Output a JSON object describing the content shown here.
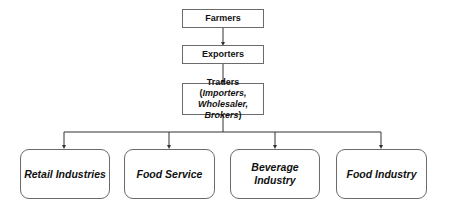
{
  "diagram": {
    "nodes": {
      "farmers": "Farmers",
      "exporters": "Exporters",
      "traders": {
        "prefix": "Traders (",
        "importers": "Importers,",
        "wholesaler": "Wholesaler,",
        "brokers": "Brokers",
        "suffix": ")"
      },
      "retail": "Retail Industries",
      "food_service": "Food Service",
      "beverage_line1": "Beverage",
      "beverage_line2": "Industry",
      "food_industry": "Food Industry"
    },
    "edges": [
      [
        "Farmers",
        "Exporters"
      ],
      [
        "Exporters",
        "Traders"
      ],
      [
        "Traders",
        "Retail Industries"
      ],
      [
        "Traders",
        "Food Service"
      ],
      [
        "Traders",
        "Beverage Industry"
      ],
      [
        "Traders",
        "Food Industry"
      ]
    ],
    "colors": {
      "border": "#6b6b6b",
      "line": "#333333",
      "text": "#111111"
    }
  }
}
